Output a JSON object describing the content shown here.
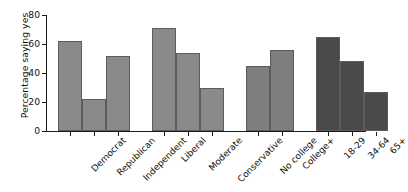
{
  "chart_data": {
    "type": "bar",
    "title": "",
    "xlabel": "",
    "ylabel": "Percentage saying yes",
    "ylim": [
      0,
      80
    ],
    "yticks": [
      0,
      20,
      40,
      60,
      80
    ],
    "ytick_labels": [
      "0",
      "20",
      "40",
      "60",
      "80"
    ],
    "grid": false,
    "legend": false,
    "categories": [
      "Democrat",
      "Republican",
      "Independent",
      "Liberal",
      "Moderate",
      "Conservative",
      "No college",
      "College+",
      "18-29",
      "34-64",
      "65+"
    ],
    "values": [
      62,
      22,
      52,
      71,
      54,
      30,
      45,
      56,
      65,
      48,
      27
    ],
    "groups": [
      {
        "name": "Party identification",
        "categories": [
          "Democrat",
          "Republican",
          "Independent"
        ],
        "values": [
          62,
          22,
          52
        ],
        "color": "#8a8a8a"
      },
      {
        "name": "Ideology",
        "categories": [
          "Liberal",
          "Moderate",
          "Conservative"
        ],
        "values": [
          71,
          54,
          30
        ],
        "color": "#8a8a8a"
      },
      {
        "name": "Education",
        "categories": [
          "No college",
          "College+"
        ],
        "values": [
          45,
          56
        ],
        "color": "#7e7e7e"
      },
      {
        "name": "Age",
        "categories": [
          "18-29",
          "34-64",
          "65+"
        ],
        "values": [
          65,
          48,
          27
        ],
        "color": "#4a4a4a"
      }
    ],
    "colors": {
      "bar_light": "#8a8a8a",
      "bar_medium": "#7e7e7e",
      "bar_dark": "#4a4a4a",
      "bar_edge": "#5c5c5c",
      "axis": "#1a1a1a",
      "background": "#ffffff"
    }
  }
}
